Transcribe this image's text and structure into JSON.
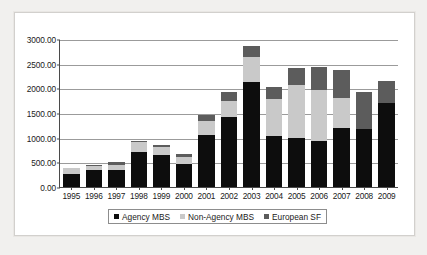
{
  "chart_data": {
    "type": "bar",
    "stacked": true,
    "title": "",
    "xlabel": "",
    "ylabel": "",
    "ylim": [
      0,
      3000
    ],
    "ytick_step": 500,
    "ytick_labels": [
      "0.00",
      "500.00",
      "1000.00",
      "1500.00",
      "2000.00",
      "2500.00",
      "3000.00"
    ],
    "ytick_values": [
      0,
      500,
      1000,
      1500,
      2000,
      2500,
      3000
    ],
    "grid": true,
    "legend_position": "bottom",
    "categories": [
      "1995",
      "1996",
      "1997",
      "1998",
      "1999",
      "2000",
      "2001",
      "2002",
      "2003",
      "2004",
      "2005",
      "2006",
      "2007",
      "2008",
      "2009"
    ],
    "series": [
      {
        "name": "Agency MBS",
        "color": "#0d0d0d",
        "values": [
          270,
          340,
          350,
          710,
          650,
          460,
          1060,
          1410,
          2120,
          1040,
          1000,
          930,
          1190,
          1180,
          1700
        ]
      },
      {
        "name": "Non-Agency MBS",
        "color": "#c9c9c9",
        "values": [
          115,
          80,
          100,
          210,
          170,
          150,
          280,
          330,
          520,
          740,
          1060,
          1030,
          620,
          0,
          0
        ]
      },
      {
        "name": "European SF",
        "color": "#5c5c5c",
        "values": [
          0,
          30,
          50,
          20,
          40,
          60,
          110,
          180,
          220,
          250,
          350,
          470,
          560,
          750,
          440
        ]
      }
    ],
    "totals": [
      385,
      450,
      500,
      940,
      860,
      670,
      1450,
      1920,
      2860,
      2030,
      2410,
      2430,
      2370,
      1930,
      2140
    ]
  },
  "legend": {
    "items": [
      {
        "label": "Agency MBS",
        "swatch": "sw-agency"
      },
      {
        "label": "Non-Agency MBS",
        "swatch": "sw-nonagency"
      },
      {
        "label": "European SF",
        "swatch": "sw-european"
      }
    ]
  }
}
